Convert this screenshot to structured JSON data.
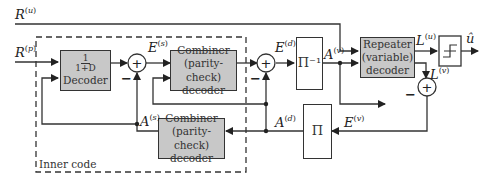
{
  "diagram": {
    "signals": {
      "r_u": {
        "base": "R",
        "sup": "u"
      },
      "r_p": {
        "base": "R",
        "sup": "p"
      },
      "e_s": {
        "base": "E",
        "sup": "s"
      },
      "e_d": {
        "base": "E",
        "sup": "d"
      },
      "a_v": {
        "base": "A",
        "sup": "v"
      },
      "l_u": {
        "base": "L",
        "sup": "u"
      },
      "l_v": {
        "base": "L",
        "sup": "v"
      },
      "u_hat": "û",
      "a_s": {
        "base": "A",
        "sup": "s"
      },
      "a_d": {
        "base": "A",
        "sup": "d"
      },
      "e_v": {
        "base": "E",
        "sup": "v"
      }
    },
    "blocks": {
      "decoder_1d": {
        "frac_num": "1",
        "frac_den": "1+D",
        "label": "Decoder"
      },
      "combiner_top": {
        "line1": "Combiner",
        "line2": "(parity-check)",
        "line3": "decoder"
      },
      "combiner_bottom": {
        "line1": "Combiner",
        "line2": "(parity-check)",
        "line3": "decoder"
      },
      "deinterleaver": "Π⁻¹",
      "interleaver": "Π",
      "repeater": {
        "line1": "Repeater",
        "line2": "(variable)",
        "line3": "decoder"
      }
    },
    "summers": {
      "symbol": "+",
      "minus": "−"
    },
    "inner_code_label": "Inner code",
    "colors": {
      "block_fill": "#c8c8c8",
      "stroke": "#333333"
    }
  }
}
